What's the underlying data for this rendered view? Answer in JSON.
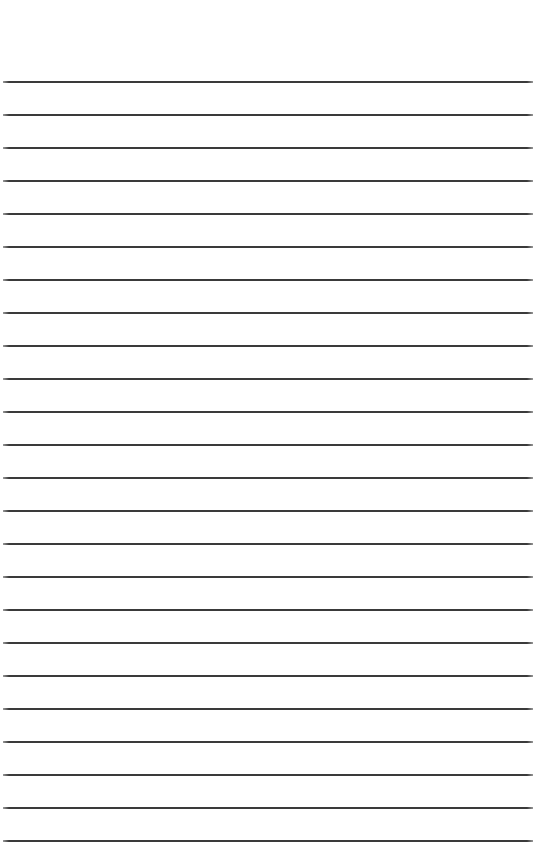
{
  "document": {
    "type": "lined-paper",
    "background_color": "#ffffff",
    "line_color": "#3a3a3a",
    "first_line_y": 81,
    "line_spacing": 33,
    "line_count": 24
  }
}
